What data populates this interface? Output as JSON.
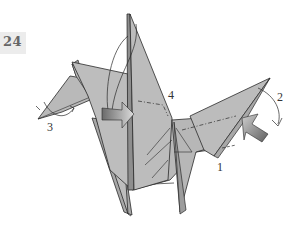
{
  "diagram": {
    "step_number": "24",
    "labels": [
      {
        "id": "1",
        "text": "1",
        "x": 218,
        "y": 162
      },
      {
        "id": "2",
        "text": "2",
        "x": 278,
        "y": 92
      },
      {
        "id": "3",
        "text": "3",
        "x": 48,
        "y": 122
      },
      {
        "id": "4",
        "text": "4",
        "x": 169,
        "y": 90
      }
    ],
    "colors": {
      "paper": "#b9b9b9",
      "paper_dark": "#8e8e8e",
      "outline": "#2a2a2a",
      "arrow_dark": "#6e6e6e",
      "arrow_light": "#d8d8d8",
      "badge_bg": "#ececec"
    }
  }
}
